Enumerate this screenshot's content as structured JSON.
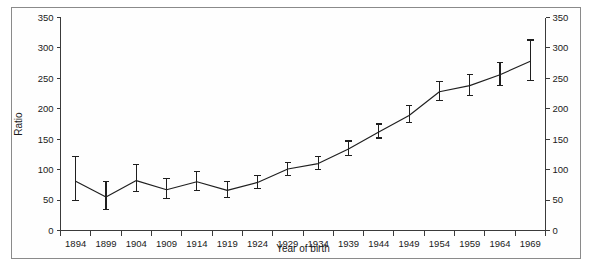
{
  "figure": {
    "background_color": "#fefefe",
    "border_color": "#8a8a8a",
    "line_color": "#1f1f1f"
  },
  "chart_data": {
    "type": "line",
    "title": "",
    "subtitle": "",
    "xlabel": "Year of birth",
    "ylabel": "Ratio",
    "ylabel_right": "Ratio",
    "grid": false,
    "legend": null,
    "legend_position": "none",
    "error_bars": true,
    "error_bar_description": "vertical 95% confidence interval with horizontal caps",
    "xlim": [
      1891.5,
      1971.5
    ],
    "ylim": [
      0,
      350
    ],
    "ytick_step": 50,
    "yticks": [
      0,
      50,
      100,
      150,
      200,
      250,
      300,
      350
    ],
    "ytick_labels": [
      "0",
      "50",
      "100",
      "150",
      "200",
      "250",
      "300",
      "350"
    ],
    "yticks_right": [
      0,
      50,
      100,
      150,
      200,
      250,
      300,
      350
    ],
    "ytick_labels_right": [
      "0",
      "50",
      "100",
      "150",
      "200",
      "250",
      "300",
      "350"
    ],
    "xtick_step": 5,
    "categories": [
      "1894",
      "1899",
      "1904",
      "1909",
      "1914",
      "1919",
      "1924",
      "1929",
      "1934",
      "1939",
      "1944",
      "1949",
      "1954",
      "1959",
      "1964",
      "1969"
    ],
    "x": [
      1894,
      1899,
      1904,
      1909,
      1914,
      1919,
      1924,
      1929,
      1934,
      1939,
      1944,
      1949,
      1954,
      1959,
      1964,
      1969
    ],
    "values": [
      81,
      55,
      82,
      67,
      80,
      66,
      79,
      101,
      110,
      134,
      162,
      189,
      228,
      238,
      256,
      278
    ],
    "ci_low": [
      50,
      35,
      64,
      52,
      65,
      54,
      69,
      91,
      100,
      123,
      152,
      178,
      213,
      222,
      238,
      247
    ],
    "ci_high": [
      121,
      81,
      109,
      85,
      97,
      80,
      91,
      112,
      122,
      147,
      175,
      205,
      245,
      256,
      276,
      313
    ],
    "series": [
      {
        "name": "Ratio",
        "values": [
          81,
          55,
          82,
          67,
          80,
          66,
          79,
          101,
          110,
          134,
          162,
          189,
          228,
          238,
          256,
          278
        ],
        "ci_low": [
          50,
          35,
          64,
          52,
          65,
          54,
          69,
          91,
          100,
          123,
          152,
          178,
          213,
          222,
          238,
          247
        ],
        "ci_high": [
          121,
          81,
          109,
          85,
          97,
          80,
          91,
          112,
          122,
          147,
          175,
          205,
          245,
          256,
          276,
          313
        ]
      }
    ]
  }
}
